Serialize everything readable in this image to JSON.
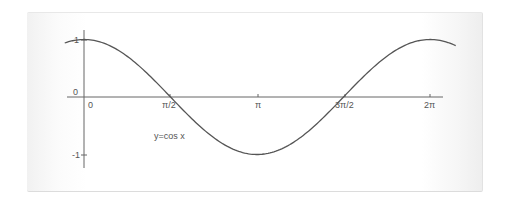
{
  "chart_data": {
    "type": "line",
    "title": "",
    "series": [
      {
        "name": "y=cos x",
        "function": "cos(x)",
        "x_range": [
          -0.35,
          6.75
        ]
      }
    ],
    "xlabel": "",
    "ylabel": "",
    "x_ticks": [
      {
        "value": 0,
        "label": "0"
      },
      {
        "value": 1.5708,
        "label": "π/2"
      },
      {
        "value": 3.1416,
        "label": "π"
      },
      {
        "value": 4.7124,
        "label": "3π/2"
      },
      {
        "value": 6.2832,
        "label": "2π"
      }
    ],
    "y_ticks": [
      {
        "value": 1,
        "label": "1"
      },
      {
        "value": 0,
        "label": "0"
      },
      {
        "value": -1,
        "label": "-1"
      }
    ],
    "xlim": [
      -0.35,
      6.75
    ],
    "ylim": [
      -1.25,
      1.2
    ],
    "grid": false,
    "annotations": [
      {
        "text": "y=cos x",
        "x": 1.5,
        "y": -0.6
      }
    ],
    "colors": {
      "curve": "#555555",
      "axis": "#666666",
      "text": "#555555"
    }
  },
  "labels": {
    "x0": "0",
    "xpi2": "π/2",
    "xpi": "π",
    "x3pi2": "3π/2",
    "x2pi": "2π",
    "y1": "1",
    "y0": "0",
    "ym1": "-1",
    "curve": "y=cos x"
  }
}
